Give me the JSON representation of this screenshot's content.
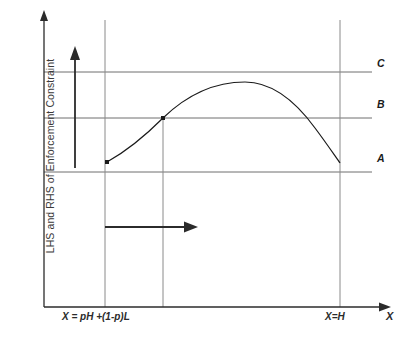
{
  "figure": {
    "axes": {
      "y_label": "LHS and RHS of Enforcement Constraint",
      "x_label": "X",
      "x_ticks": [
        {
          "name": "pooling-point",
          "label": "X = pH +(1-p)L",
          "x": 105
        },
        {
          "name": "high-point",
          "label": "X=H",
          "x": 340
        }
      ]
    },
    "levels": [
      {
        "key": "C",
        "label": "C",
        "y": 72
      },
      {
        "key": "B",
        "label": "B",
        "y": 118
      },
      {
        "key": "A",
        "label": "A",
        "y": 172
      }
    ],
    "curve": {
      "name": "lhs-enforcement-curve",
      "start": {
        "x": 107,
        "y": 162
      },
      "crossing_b": {
        "x": 163,
        "y": 118
      },
      "peak": {
        "x": 245,
        "y": 82
      },
      "end": {
        "x": 340,
        "y": 163
      }
    },
    "annotations": {
      "vertical_arrow": {
        "name": "vertical-shift-arrow",
        "x": 75,
        "y_from": 168,
        "y_to": 52
      },
      "horizontal_arrow": {
        "name": "horizontal-shift-arrow",
        "y": 227,
        "x_from": 105,
        "x_to": 196
      }
    },
    "colors": {
      "axis": "#2b2b2b",
      "gridline": "#6f6f6f",
      "curve": "#1a1a1a",
      "arrow": "#2b2b2b",
      "label": "#3a3a3a",
      "background": "#ffffff"
    }
  }
}
